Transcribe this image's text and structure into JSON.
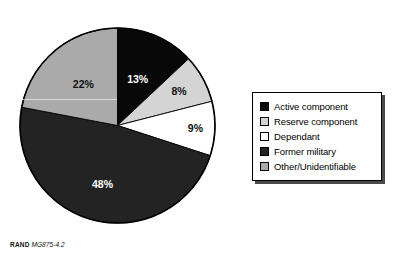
{
  "figure": {
    "caption_prefix": "RAND",
    "caption_number": "MG875-4.2"
  },
  "chart_data": {
    "type": "pie",
    "title": "",
    "subtitle": "",
    "xlabel": "",
    "ylabel": "",
    "start_angle_deg": 0,
    "direction": "clockwise",
    "grid": false,
    "legend_position": "right",
    "categories": [
      "Active component",
      "Reserve component",
      "Dependant",
      "Former military",
      "Other/Unidentifiable"
    ],
    "values": [
      13,
      8,
      9,
      48,
      22
    ],
    "data_labels": [
      "13%",
      "8%",
      "9%",
      "48%",
      "22%"
    ],
    "colors": [
      "#080808",
      "#d4d4d4",
      "#ffffff",
      "#232323",
      "#aaaaaa"
    ],
    "label_text_colors": [
      "#ffffff",
      "#111111",
      "#111111",
      "#ffffff",
      "#111111"
    ],
    "slices": [
      {
        "label": "Active component",
        "value": 13,
        "data_label": "13%",
        "color": "#080808",
        "label_color": "#ffffff"
      },
      {
        "label": "Reserve component",
        "value": 8,
        "data_label": "8%",
        "color": "#d4d4d4",
        "label_color": "#111111"
      },
      {
        "label": "Dependant",
        "value": 9,
        "data_label": "9%",
        "color": "#ffffff",
        "label_color": "#111111"
      },
      {
        "label": "Former military",
        "value": 48,
        "data_label": "48%",
        "color": "#232323",
        "label_color": "#ffffff"
      },
      {
        "label": "Other/Unidentifiable",
        "value": 22,
        "data_label": "22%",
        "color": "#aaaaaa",
        "label_color": "#111111"
      }
    ]
  },
  "legend": {
    "items": [
      {
        "label": "Active component",
        "color": "#080808"
      },
      {
        "label": "Reserve component",
        "color": "#d4d4d4"
      },
      {
        "label": "Dependant",
        "color": "#ffffff"
      },
      {
        "label": "Former military",
        "color": "#232323"
      },
      {
        "label": "Other/Unidentifiable",
        "color": "#aaaaaa"
      }
    ]
  }
}
